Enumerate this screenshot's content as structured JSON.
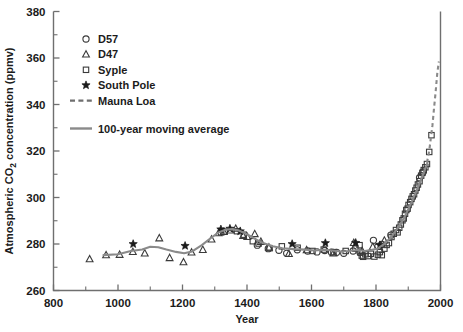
{
  "chart_data": {
    "type": "scatter",
    "title": "",
    "xlabel": "Year",
    "ylabel": "Atmospheric CO2 concentration (ppmv)",
    "ylabel_prefix": "Atmospheric CO",
    "ylabel_sub": "2",
    "ylabel_suffix": " concentration (ppmv)",
    "xlim": [
      800,
      2000
    ],
    "ylim": [
      260,
      380
    ],
    "xticks": [
      800,
      1000,
      1200,
      1400,
      1600,
      1800,
      2000
    ],
    "yticks": [
      260,
      280,
      300,
      320,
      340,
      360,
      380
    ],
    "x_minor_step": 100,
    "y_minor_step": 10,
    "grid": false,
    "legend_position": "upper-left-inside",
    "legend": [
      {
        "label": "D57",
        "marker": "circle-open"
      },
      {
        "label": "D47",
        "marker": "triangle-open"
      },
      {
        "label": "Syple",
        "marker": "square-open"
      },
      {
        "label": "South Pole",
        "marker": "star-filled"
      },
      {
        "label": "Mauna Loa",
        "marker": "dashed-line"
      },
      {
        "label": "100-year moving average",
        "marker": "solid-line"
      }
    ],
    "series": [
      {
        "name": "D57",
        "marker": "circle-open",
        "points": [
          [
            1432,
            279.5
          ],
          [
            1466,
            278.0
          ],
          [
            1499,
            277.3
          ],
          [
            1523,
            276.0
          ],
          [
            1556,
            277.5
          ],
          [
            1588,
            277.0
          ],
          [
            1617,
            276.6
          ],
          [
            1641,
            277.2
          ],
          [
            1662,
            276.5
          ],
          [
            1678,
            276.4
          ],
          [
            1700,
            276.0
          ],
          [
            1729,
            277.0
          ],
          [
            1750,
            276.5
          ],
          [
            1792,
            281.6
          ],
          [
            1806,
            279.0
          ],
          [
            1818,
            279.8
          ],
          [
            1846,
            283.8
          ],
          [
            1935,
            308.5
          ],
          [
            1946,
            311.0
          ]
        ]
      },
      {
        "name": "D47",
        "marker": "triangle-open",
        "points": [
          [
            912,
            273.5
          ],
          [
            963,
            275.2
          ],
          [
            1005,
            275.4
          ],
          [
            1046,
            276.6
          ],
          [
            1083,
            276.0
          ],
          [
            1128,
            282.5
          ],
          [
            1160,
            274.0
          ],
          [
            1203,
            272.2
          ],
          [
            1228,
            276.4
          ],
          [
            1263,
            277.5
          ],
          [
            1290,
            282.0
          ],
          [
            1312,
            284.7
          ],
          [
            1328,
            285.2
          ],
          [
            1348,
            285.9
          ],
          [
            1365,
            286.6
          ],
          [
            1388,
            283.5
          ],
          [
            1401,
            283.1
          ],
          [
            1424,
            284.3
          ],
          [
            1443,
            281.0
          ],
          [
            1468,
            278.5
          ],
          [
            1530,
            275.8
          ],
          [
            1585,
            277.4
          ],
          [
            1668,
            276.0
          ],
          [
            1731,
            280.5
          ],
          [
            1757,
            277.0
          ],
          [
            1790,
            278.8
          ],
          [
            1826,
            281.5
          ]
        ]
      },
      {
        "name": "Syple",
        "marker": "square-open",
        "points": [
          [
            1320,
            285.0
          ],
          [
            1331,
            285.4
          ],
          [
            1369,
            285.5
          ],
          [
            1390,
            284.0
          ],
          [
            1418,
            281.2
          ],
          [
            1436,
            280.2
          ],
          [
            1470,
            278.2
          ],
          [
            1508,
            279.0
          ],
          [
            1557,
            278.4
          ],
          [
            1603,
            277.0
          ],
          [
            1638,
            277.6
          ],
          [
            1668,
            276.5
          ],
          [
            1706,
            277.0
          ],
          [
            1736,
            278.0
          ],
          [
            1749,
            279.5
          ],
          [
            1752,
            276.3
          ],
          [
            1756,
            275.0
          ],
          [
            1760,
            274.5
          ],
          [
            1767,
            275.6
          ],
          [
            1775,
            274.8
          ],
          [
            1784,
            275.8
          ],
          [
            1795,
            274.6
          ],
          [
            1806,
            275.4
          ],
          [
            1812,
            276.5
          ],
          [
            1818,
            275.2
          ],
          [
            1826,
            278.0
          ],
          [
            1833,
            279.6
          ],
          [
            1840,
            280.4
          ],
          [
            1848,
            283.0
          ],
          [
            1855,
            284.4
          ],
          [
            1862,
            286.0
          ],
          [
            1867,
            285.0
          ],
          [
            1872,
            287.0
          ],
          [
            1877,
            288.4
          ],
          [
            1882,
            290.2
          ],
          [
            1886,
            291.0
          ],
          [
            1890,
            293.0
          ],
          [
            1894,
            294.6
          ],
          [
            1898,
            295.2
          ],
          [
            1901,
            296.8
          ],
          [
            1906,
            298.0
          ],
          [
            1910,
            299.4
          ],
          [
            1914,
            300.5
          ],
          [
            1918,
            301.4
          ],
          [
            1922,
            303.0
          ],
          [
            1926,
            304.2
          ],
          [
            1930,
            305.6
          ],
          [
            1935,
            307.0
          ],
          [
            1940,
            309.4
          ],
          [
            1944,
            310.6
          ],
          [
            1948,
            311.8
          ],
          [
            1953,
            313.0
          ],
          [
            1958,
            314.4
          ],
          [
            1965,
            319.6
          ],
          [
            1972,
            326.8
          ]
        ]
      },
      {
        "name": "South Pole",
        "marker": "star-filled",
        "points": [
          [
            1047,
            280.0
          ],
          [
            1208,
            279.2
          ],
          [
            1319,
            286.3
          ],
          [
            1347,
            286.6
          ],
          [
            1379,
            285.5
          ],
          [
            1540,
            280.0
          ],
          [
            1643,
            280.4
          ],
          [
            1737,
            280.5
          ],
          [
            1812,
            279.5
          ]
        ]
      }
    ],
    "mauna_loa_line": [
      [
        1958,
        315.0
      ],
      [
        1965,
        320.0
      ],
      [
        1970,
        325.5
      ],
      [
        1975,
        331.0
      ],
      [
        1980,
        338.5
      ],
      [
        1985,
        345.5
      ],
      [
        1990,
        353.5
      ],
      [
        1995,
        358.5
      ]
    ],
    "moving_average_line": [
      [
        955,
        275.2
      ],
      [
        1000,
        275.6
      ],
      [
        1040,
        277.0
      ],
      [
        1075,
        277.6
      ],
      [
        1100,
        278.8
      ],
      [
        1125,
        278.6
      ],
      [
        1150,
        277.6
      ],
      [
        1180,
        276.6
      ],
      [
        1205,
        276.0
      ],
      [
        1230,
        276.8
      ],
      [
        1260,
        279.5
      ],
      [
        1290,
        282.8
      ],
      [
        1312,
        285.0
      ],
      [
        1335,
        286.2
      ],
      [
        1355,
        286.4
      ],
      [
        1375,
        285.8
      ],
      [
        1400,
        284.2
      ],
      [
        1425,
        282.2
      ],
      [
        1450,
        280.4
      ],
      [
        1480,
        279.0
      ],
      [
        1510,
        278.2
      ],
      [
        1545,
        277.8
      ],
      [
        1580,
        277.6
      ],
      [
        1610,
        277.2
      ],
      [
        1640,
        277.5
      ],
      [
        1665,
        277.2
      ],
      [
        1690,
        276.8
      ],
      [
        1715,
        277.0
      ],
      [
        1745,
        277.4
      ],
      [
        1765,
        277.0
      ],
      [
        1785,
        277.4
      ],
      [
        1805,
        278.0
      ],
      [
        1825,
        280.0
      ],
      [
        1845,
        282.6
      ],
      [
        1860,
        285.4
      ],
      [
        1875,
        288.4
      ],
      [
        1890,
        292.0
      ],
      [
        1905,
        296.4
      ],
      [
        1920,
        301.0
      ],
      [
        1935,
        306.0
      ],
      [
        1950,
        311.4
      ],
      [
        1960,
        315.0
      ]
    ]
  }
}
